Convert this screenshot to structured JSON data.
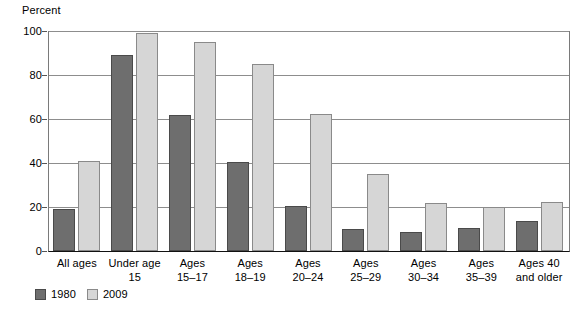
{
  "chart_data": {
    "type": "bar",
    "title": "",
    "subtitle": "",
    "xlabel": "",
    "ylabel": "Percent",
    "ylim": [
      0,
      100
    ],
    "yticks": [
      0,
      20,
      40,
      60,
      80,
      100
    ],
    "ytick_labels": [
      "0",
      "20",
      "40",
      "60",
      "80",
      "100"
    ],
    "grid": true,
    "legend_position": "bottom-left",
    "categories": [
      "All ages",
      "Under age 15",
      "Ages 15–17",
      "Ages 18–19",
      "Ages 20–24",
      "Ages 25–29",
      "Ages 30–34",
      "Ages 35–39",
      "Ages 40 and older"
    ],
    "category_lines": [
      [
        "All ages"
      ],
      [
        "Under age",
        "15"
      ],
      [
        "Ages",
        "15–17"
      ],
      [
        "Ages",
        "18–19"
      ],
      [
        "Ages",
        "20–24"
      ],
      [
        "Ages",
        "25–29"
      ],
      [
        "Ages",
        "30–34"
      ],
      [
        "Ages",
        "35–39"
      ],
      [
        "Ages 40",
        "and older"
      ]
    ],
    "series": [
      {
        "name": "1980",
        "color": "#6e6e6e",
        "values": [
          19,
          89,
          62,
          40.5,
          20.5,
          10,
          8.5,
          10.5,
          13.5
        ]
      },
      {
        "name": "2009",
        "color": "#d6d6d6",
        "values": [
          41,
          99,
          95,
          85,
          62.5,
          35,
          22,
          20,
          22.5
        ]
      }
    ]
  },
  "axis": {
    "y_title": "Percent"
  },
  "legend": {
    "entries": [
      {
        "label": "1980"
      },
      {
        "label": "2009"
      }
    ]
  },
  "colors": {
    "series_1980": "#6e6e6e",
    "series_1980_border": "#4a4a4a",
    "series_2009": "#d6d6d6",
    "series_2009_border": "#8a8a8a",
    "gridline": "#8d8d8d",
    "axis": "#111111",
    "background": "#ffffff"
  }
}
